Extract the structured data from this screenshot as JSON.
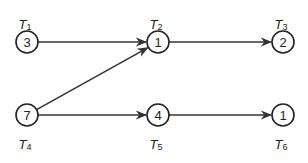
{
  "diagram": {
    "type": "task-dependency-graph",
    "nodes": [
      {
        "id": "T1",
        "label": "T",
        "sub": "1",
        "value": "3",
        "x": 27,
        "y": 42,
        "label_pos": "above"
      },
      {
        "id": "T2",
        "label": "T",
        "sub": "2",
        "value": "1",
        "x": 158,
        "y": 42,
        "label_pos": "above"
      },
      {
        "id": "T3",
        "label": "T",
        "sub": "3",
        "value": "2",
        "x": 283,
        "y": 42,
        "label_pos": "above"
      },
      {
        "id": "T4",
        "label": "T",
        "sub": "4",
        "value": "7",
        "x": 27,
        "y": 115,
        "label_pos": "below"
      },
      {
        "id": "T5",
        "label": "T",
        "sub": "5",
        "value": "4",
        "x": 158,
        "y": 115,
        "label_pos": "below"
      },
      {
        "id": "T6",
        "label": "T",
        "sub": "6",
        "value": "1",
        "x": 283,
        "y": 115,
        "label_pos": "below"
      }
    ],
    "edges": [
      {
        "from": "T1",
        "to": "T2"
      },
      {
        "from": "T2",
        "to": "T3"
      },
      {
        "from": "T4",
        "to": "T2"
      },
      {
        "from": "T4",
        "to": "T5"
      },
      {
        "from": "T5",
        "to": "T6"
      }
    ],
    "colors": {
      "stroke": "#222222",
      "background": "#ffffff"
    }
  }
}
